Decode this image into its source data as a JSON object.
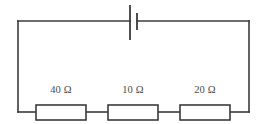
{
  "figure": {
    "width": 261,
    "height": 124,
    "background_color": "#ffffff",
    "line_color": "#3b3b3b",
    "text_color": "#4a4a4a"
  },
  "circuit": {
    "loop": {
      "left": 18,
      "right": 249,
      "top": 21,
      "bottom": 112
    },
    "battery": {
      "name": "battery",
      "symbol": "battery-cell",
      "label": "",
      "position_x": 133,
      "long_plate": {
        "x": 130,
        "y_top": 5,
        "y_bottom": 40
      },
      "short_plate": {
        "x": 137,
        "y_top": 13,
        "y_bottom": 30
      }
    },
    "resistors": [
      {
        "id": "r1",
        "name": "resistor-40-ohm",
        "label": "40 Ω",
        "value": 40,
        "unit": "Ω",
        "box": {
          "x": 36,
          "y": 105,
          "width": 50,
          "height": 15
        }
      },
      {
        "id": "r2",
        "name": "resistor-10-ohm",
        "label": "10 Ω",
        "value": 10,
        "unit": "Ω",
        "box": {
          "x": 108,
          "y": 105,
          "width": 50,
          "height": 15
        }
      },
      {
        "id": "r3",
        "name": "resistor-20-ohm",
        "label": "20 Ω",
        "value": 20,
        "unit": "Ω",
        "box": {
          "x": 180,
          "y": 105,
          "width": 50,
          "height": 15
        }
      }
    ]
  }
}
